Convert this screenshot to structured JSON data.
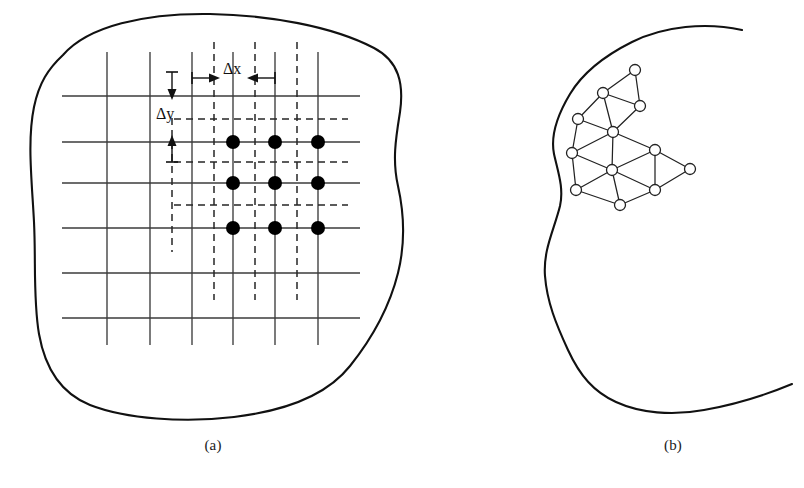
{
  "figure": {
    "domain_type": "engineering-discretization-diagram",
    "panels": [
      {
        "id": "a",
        "label": "(a)",
        "description": "finite-difference rectangular grid inside an irregular domain"
      },
      {
        "id": "b",
        "label": "(b)",
        "description": "finite-element triangular mesh inside a curved domain"
      }
    ],
    "caption_partial": ""
  },
  "colors": {
    "ink": "#111111",
    "boundary": "#111111",
    "grid_solid": "#3a3a3a",
    "grid_dashed": "#2a2a2a",
    "node_fill": "#000000",
    "mesh_node_fill": "#ffffff",
    "background": "#ffffff"
  },
  "panel_a": {
    "labels": {
      "delta_x": "Δx",
      "delta_y": "Δy"
    },
    "grid": {
      "solid_vertical_x": [
        107,
        150,
        192,
        233,
        275,
        318
      ],
      "solid_horizontal_y": [
        96,
        142,
        183,
        228,
        273,
        318
      ],
      "dashed_vertical_x": [
        172,
        214,
        255,
        297
      ],
      "dashed_horizontal_y": [
        119,
        162,
        205,
        250
      ],
      "spacing_dx": 42,
      "spacing_dy": 44,
      "solid_v_extent": [
        52,
        345
      ],
      "solid_h_extent": [
        62,
        360
      ],
      "dashed_v_extent": [
        40,
        300
      ],
      "dashed_h_extent": [
        175,
        348
      ]
    },
    "nodes": {
      "count": 9,
      "x": [
        235,
        277,
        318
      ],
      "y": [
        141,
        183,
        228
      ],
      "radius": 7
    },
    "boundary_outline": "M 63,54 C 90,24 150,12 215,14 C 270,16 330,26 372,46 C 398,58 404,82 400,110 C 396,136 392,160 398,186 C 404,212 406,240 398,272 C 390,304 376,334 352,364 C 328,394 286,410 236,416 C 186,422 128,418 92,404 C 62,392 46,368 40,334 C 34,300 36,262 34,222 C 32,182 28,142 34,108 C 38,84 48,68 63,54 Z"
  },
  "panel_b": {
    "boundary_outline": "M 736,30 C 700,24 660,28 628,44 C 600,58 580,76 568,96 C 556,116 548,136 552,156 C 556,176 564,192 560,210 C 554,232 544,252 546,276 C 548,300 556,322 568,348 C 580,374 594,392 616,404 C 640,416 672,418 704,412 C 736,406 766,396 790,386",
    "mesh": {
      "node_radius": 5.5,
      "nodes": [
        {
          "id": 0,
          "x": 635,
          "y": 70
        },
        {
          "id": 1,
          "x": 603,
          "y": 93
        },
        {
          "id": 2,
          "x": 640,
          "y": 106
        },
        {
          "id": 3,
          "x": 578,
          "y": 119
        },
        {
          "id": 4,
          "x": 613,
          "y": 132
        },
        {
          "id": 5,
          "x": 572,
          "y": 153
        },
        {
          "id": 6,
          "x": 655,
          "y": 150
        },
        {
          "id": 7,
          "x": 612,
          "y": 170
        },
        {
          "id": 8,
          "x": 690,
          "y": 169
        },
        {
          "id": 9,
          "x": 576,
          "y": 190
        },
        {
          "id": 10,
          "x": 655,
          "y": 190
        },
        {
          "id": 11,
          "x": 620,
          "y": 205
        },
        {
          "id": 12,
          "x": 690,
          "y": 158
        }
      ],
      "edges": [
        [
          0,
          1
        ],
        [
          0,
          2
        ],
        [
          1,
          2
        ],
        [
          1,
          3
        ],
        [
          1,
          4
        ],
        [
          2,
          4
        ],
        [
          3,
          4
        ],
        [
          3,
          5
        ],
        [
          4,
          5
        ],
        [
          4,
          6
        ],
        [
          4,
          7
        ],
        [
          5,
          7
        ],
        [
          5,
          9
        ],
        [
          6,
          7
        ],
        [
          6,
          8
        ],
        [
          6,
          10
        ],
        [
          7,
          9
        ],
        [
          7,
          10
        ],
        [
          7,
          11
        ],
        [
          8,
          10
        ],
        [
          9,
          11
        ],
        [
          10,
          11
        ]
      ]
    }
  }
}
